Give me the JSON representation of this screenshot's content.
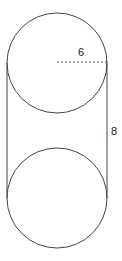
{
  "diagram": {
    "type": "cylinder-net",
    "labels": {
      "radius": "6",
      "height": "8"
    },
    "colors": {
      "stroke": "#444444",
      "background": "#ffffff"
    }
  }
}
